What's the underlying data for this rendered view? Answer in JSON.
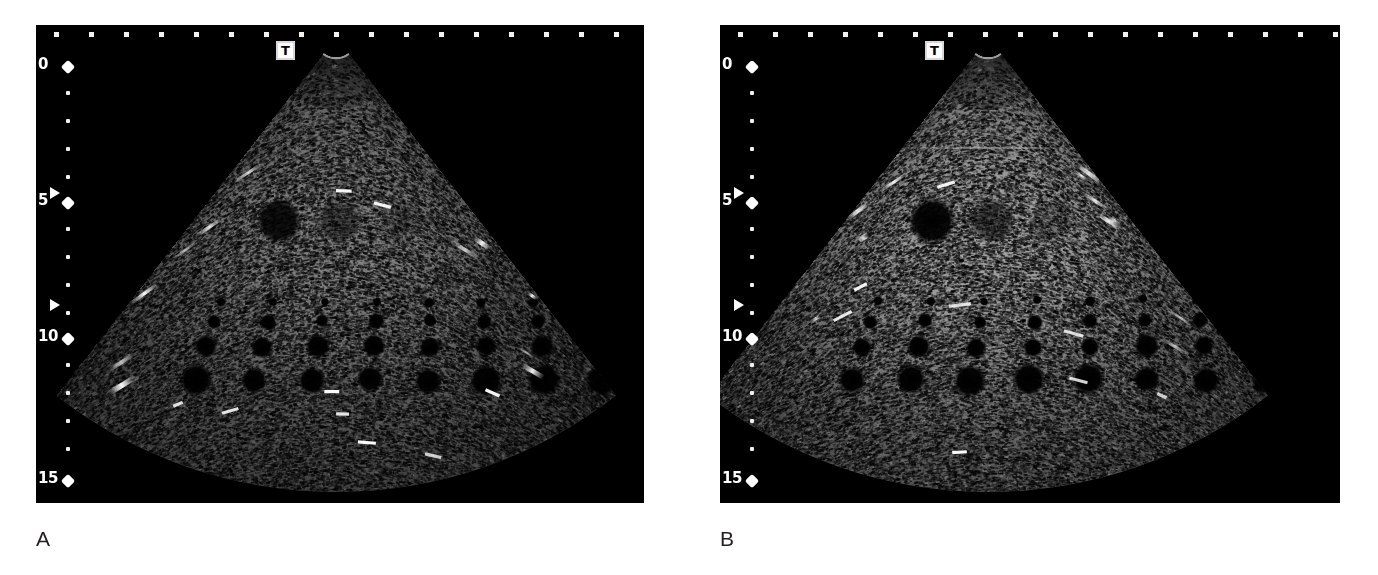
{
  "figure": {
    "kind": "ultrasound-phantom-comparison",
    "background": "#ffffff",
    "width": 1378,
    "height": 575
  },
  "panels": [
    {
      "id": "a",
      "label": "A",
      "x": 36,
      "y": 25,
      "width": 608,
      "height": 478,
      "background": "#000000",
      "transducer_marker": "T",
      "transducer_marker_x": 240,
      "depth_scale": {
        "unit": "cm",
        "labels": [
          "0",
          "5",
          "10",
          "15"
        ],
        "label_y": [
          38,
          174,
          310,
          452
        ],
        "minor_tick_y": [
          66,
          94,
          122,
          150,
          202,
          230,
          258,
          286,
          338,
          366,
          394,
          422
        ],
        "focal_markers_y": [
          168,
          280
        ],
        "tick_color": "#efefef"
      },
      "sector": {
        "apex_x": 300,
        "top_y": 12,
        "bottom_y": 462,
        "half_angle_deg": 38,
        "near_field_radius": 20,
        "far_field_radius": 455
      },
      "gain": "lower",
      "speckle_brightness": 0.8,
      "targets": {
        "contrast_row_y": 196,
        "contrast_targets": [
          {
            "cx": 243,
            "cy": 196,
            "r": 23,
            "tone": "anechoic",
            "level": -18
          },
          {
            "cx": 303,
            "cy": 196,
            "r": 22,
            "tone": "hypoechoic",
            "level": -9
          },
          {
            "cx": 362,
            "cy": 196,
            "r": 21,
            "tone": "hypoechoic",
            "level": -4
          },
          {
            "cx": 423,
            "cy": 196,
            "r": 20,
            "tone": "isoechoic",
            "level": 0
          },
          {
            "cx": 472,
            "cy": 196,
            "r": 20,
            "tone": "hyperechoic",
            "level": 6
          },
          {
            "cx": 525,
            "cy": 196,
            "r": 23,
            "tone": "hyperechoic",
            "level": 15
          }
        ],
        "pin_rows": [
          {
            "y": 277,
            "radius": 4,
            "count": 8,
            "x_start": 185,
            "x_step": 52
          },
          {
            "y": 297,
            "radius": 6,
            "count": 8,
            "x_start": 178,
            "x_step": 54
          },
          {
            "y": 322,
            "radius": 9,
            "count": 8,
            "x_start": 170,
            "x_step": 56
          },
          {
            "y": 355,
            "radius": 12,
            "count": 8,
            "x_start": 160,
            "x_step": 58
          }
        ]
      },
      "artifacts": {
        "edge_streaks_left": 6,
        "edge_streaks_right": 5,
        "bright_specks": 9
      }
    },
    {
      "id": "b",
      "label": "B",
      "x": 720,
      "y": 25,
      "width": 620,
      "height": 478,
      "background": "#000000",
      "transducer_marker": "T",
      "transducer_marker_x": 205,
      "depth_scale": {
        "unit": "cm",
        "labels": [
          "0",
          "5",
          "10",
          "15"
        ],
        "label_y": [
          38,
          174,
          310,
          452
        ],
        "minor_tick_y": [
          66,
          94,
          122,
          150,
          202,
          230,
          258,
          286,
          338,
          366,
          394,
          422
        ],
        "focal_markers_y": [
          168,
          280
        ],
        "tick_color": "#efefef"
      },
      "sector": {
        "apex_x": 268,
        "top_y": 12,
        "bottom_y": 462,
        "half_angle_deg": 38,
        "near_field_radius": 20,
        "far_field_radius": 455
      },
      "gain": "higher",
      "speckle_brightness": 1.0,
      "targets": {
        "contrast_row_y": 196,
        "contrast_targets": [
          {
            "cx": 212,
            "cy": 196,
            "r": 24,
            "tone": "anechoic",
            "level": -20
          },
          {
            "cx": 272,
            "cy": 196,
            "r": 23,
            "tone": "hypoechoic",
            "level": -11
          },
          {
            "cx": 330,
            "cy": 196,
            "r": 22,
            "tone": "hypoechoic",
            "level": -5
          },
          {
            "cx": 390,
            "cy": 196,
            "r": 21,
            "tone": "isoechoic",
            "level": 0
          },
          {
            "cx": 447,
            "cy": 196,
            "r": 22,
            "tone": "hyperechoic",
            "level": 9
          },
          {
            "cx": 505,
            "cy": 196,
            "r": 25,
            "tone": "hyperechoic",
            "level": 18
          }
        ],
        "pin_rows": [
          {
            "y": 275,
            "radius": 4,
            "count": 8,
            "x_start": 158,
            "x_step": 53
          },
          {
            "y": 296,
            "radius": 6,
            "count": 8,
            "x_start": 150,
            "x_step": 55
          },
          {
            "y": 322,
            "radius": 9,
            "count": 8,
            "x_start": 142,
            "x_step": 57
          },
          {
            "y": 355,
            "radius": 12,
            "count": 8,
            "x_start": 132,
            "x_step": 59
          }
        ]
      },
      "artifacts": {
        "edge_streaks_left": 4,
        "edge_streaks_right": 7,
        "bright_specks": 8,
        "horizontal_line_y": 123
      }
    }
  ],
  "labels": {
    "panel_a": "A",
    "panel_b": "B",
    "color": "#231f20"
  }
}
